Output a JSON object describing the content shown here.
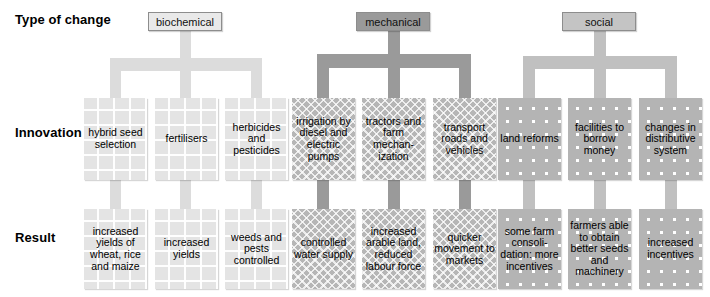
{
  "rows": {
    "type_label": "Type of change",
    "innovation_label": "Innovation",
    "result_label": "Result"
  },
  "colors": {
    "biochemical_chip": "#e9e9e9",
    "mechanical_chip": "#9a9a9a",
    "social_chip": "#c4c4c4",
    "biochemical_cell": "#e4e4e4",
    "mechanical_cell": "#b6b6b6",
    "social_cell": "#b4b4b4",
    "connector_light": "#dcdcdc",
    "connector_mid": "#9a9a9a",
    "connector_social": "#c0c0c0",
    "text": "#000000"
  },
  "categories": [
    {
      "id": "biochemical",
      "label": "biochemical"
    },
    {
      "id": "mechanical",
      "label": "mechanical"
    },
    {
      "id": "social",
      "label": "social"
    }
  ],
  "columns": [
    {
      "category": "biochemical",
      "innovation": "hybrid seed selection",
      "result": "increased yields of wheat, rice and maize"
    },
    {
      "category": "biochemical",
      "innovation": "fertilisers",
      "result": "increased yields"
    },
    {
      "category": "biochemical",
      "innovation": "herbicides and pesticides",
      "result": "weeds and pests controlled"
    },
    {
      "category": "mechanical",
      "innovation": "irrigation by diesel and electric pumps",
      "result": "controlled water supply"
    },
    {
      "category": "mechanical",
      "innovation": "tractors and farm mechan- ization",
      "result": "increased arable land, reduced labour force"
    },
    {
      "category": "mechanical",
      "innovation": "transport roads and vehicles",
      "result": "quicker movement to markets"
    },
    {
      "category": "social",
      "innovation": "land reforms",
      "result": "some farm consoli- dation: more incentives"
    },
    {
      "category": "social",
      "innovation": "facilities to borrow money",
      "result": "farmers able to obtain better seeds and machinery"
    },
    {
      "category": "social",
      "innovation": "changes in distributive system",
      "result": "increased incentives"
    }
  ]
}
